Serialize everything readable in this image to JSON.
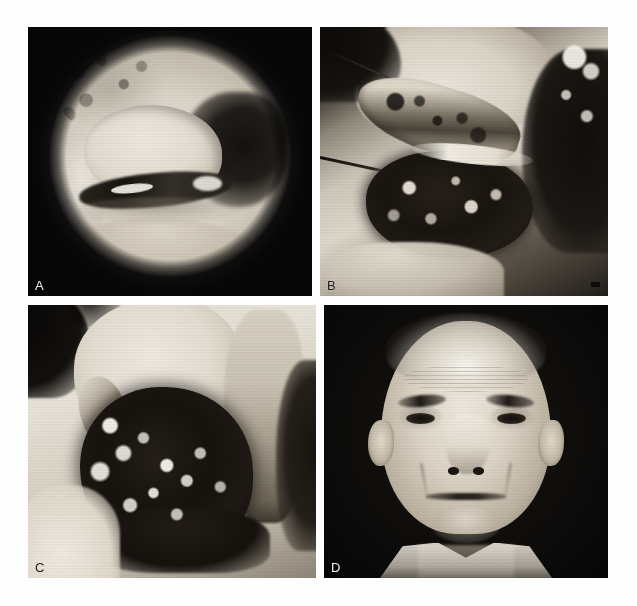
{
  "figure": {
    "background_color": "#ffffff",
    "layout": "2x2 grid of black-and-white photographs",
    "panel_count": 4
  },
  "panels": [
    {
      "id": "panel-a",
      "label": "A",
      "label_color": "#f2f2f2",
      "label_position": "bottom-left",
      "modality": "endoscopic",
      "description": "Circular endoscopic (laryngoscopic) view with dark vignetted corners; pale mucosal field with a rounded mass and a dark glottic shadow to the right",
      "background_color": "#0a0a0a",
      "has_scale_bar": false
    },
    {
      "id": "panel-b",
      "label": "B",
      "label_color": "#1b1b1b",
      "label_position": "bottom-left",
      "modality": "intraoperative-specimen",
      "description": "Operative photograph of a resected specimen: a pale elongated strip of tissue above a dark haemorrhagic/necrotic mass, with surgical instruments and drapes",
      "background_color": "#151310",
      "has_scale_bar": true,
      "scale_bar_color": "#0b0b0b"
    },
    {
      "id": "panel-c",
      "label": "C",
      "label_color": "#1b1b1b",
      "label_position": "bottom-left",
      "modality": "intraoperative-field",
      "description": "Operative field of the neck showing a large dark tumour mass with bright flecks, retracted skin flaps and surrounding tissue",
      "background_color": "#e4ded2",
      "has_scale_bar": false
    },
    {
      "id": "panel-d",
      "label": "D",
      "label_color": "#f2f2f2",
      "label_position": "bottom-left",
      "modality": "clinical-portrait",
      "description": "Frontal clinical portrait photograph of an elderly man against a dark background, wearing an open-collared light shirt",
      "background_color": "#090909",
      "has_scale_bar": false
    }
  ]
}
